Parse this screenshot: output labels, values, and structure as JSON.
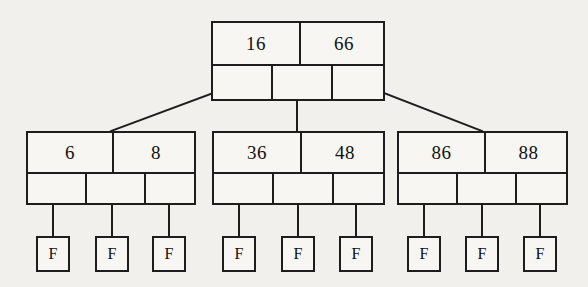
{
  "diagram": {
    "style": {
      "background_color": "#f2f0ed",
      "node_fill": "#f7f6f3",
      "line_color": "#1d1d1d"
    },
    "root": {
      "id": "root-node",
      "keys": [
        "16",
        "66"
      ],
      "x": 211,
      "y": 21,
      "width": 174,
      "height": 80,
      "key_row_height": 41,
      "key_widths": [
        86,
        86
      ],
      "pointer_widths": [
        58,
        58,
        56
      ]
    },
    "internal_nodes": [
      {
        "id": "internal-node-left",
        "keys": [
          "6",
          "8"
        ],
        "x": 26,
        "y": 131,
        "width": 170,
        "height": 74,
        "key_row_height": 39,
        "key_widths": [
          84,
          84
        ],
        "pointer_widths": [
          57,
          57,
          54
        ]
      },
      {
        "id": "internal-node-middle",
        "keys": [
          "36",
          "48"
        ],
        "x": 212,
        "y": 131,
        "width": 173,
        "height": 74,
        "key_row_height": 39,
        "key_widths": [
          86,
          86
        ],
        "pointer_widths": [
          58,
          58,
          55
        ]
      },
      {
        "id": "internal-node-right",
        "keys": [
          "86",
          "88"
        ],
        "x": 397,
        "y": 131,
        "width": 171,
        "height": 74,
        "key_row_height": 39,
        "key_widths": [
          85,
          85
        ],
        "pointer_widths": [
          57,
          57,
          55
        ]
      }
    ],
    "leaves": [
      {
        "id": "leaf-1",
        "label": "F",
        "x": 36,
        "y": 236,
        "width": 34,
        "height": 36
      },
      {
        "id": "leaf-2",
        "label": "F",
        "x": 95,
        "y": 236,
        "width": 34,
        "height": 36
      },
      {
        "id": "leaf-3",
        "label": "F",
        "x": 152,
        "y": 236,
        "width": 34,
        "height": 36
      },
      {
        "id": "leaf-4",
        "label": "F",
        "x": 222,
        "y": 236,
        "width": 34,
        "height": 36
      },
      {
        "id": "leaf-5",
        "label": "F",
        "x": 281,
        "y": 236,
        "width": 34,
        "height": 36
      },
      {
        "id": "leaf-6",
        "label": "F",
        "x": 339,
        "y": 236,
        "width": 34,
        "height": 36
      },
      {
        "id": "leaf-7",
        "label": "F",
        "x": 407,
        "y": 236,
        "width": 34,
        "height": 36
      },
      {
        "id": "leaf-8",
        "label": "F",
        "x": 465,
        "y": 236,
        "width": 34,
        "height": 36
      },
      {
        "id": "leaf-9",
        "label": "F",
        "x": 523,
        "y": 236,
        "width": 34,
        "height": 36
      }
    ],
    "edges": [
      {
        "id": "edge-root-to-left",
        "x1": 240,
        "y1": 83,
        "x2": 111,
        "y2": 131
      },
      {
        "id": "edge-root-to-middle",
        "x1": 297,
        "y1": 83,
        "x2": 297,
        "y2": 131
      },
      {
        "id": "edge-root-to-right",
        "x1": 358,
        "y1": 83,
        "x2": 482,
        "y2": 131
      },
      {
        "id": "edge-left-to-leaf-1",
        "x1": 53,
        "y1": 186,
        "x2": 53,
        "y2": 236
      },
      {
        "id": "edge-left-to-leaf-2",
        "x1": 112,
        "y1": 186,
        "x2": 112,
        "y2": 236
      },
      {
        "id": "edge-left-to-leaf-3",
        "x1": 169,
        "y1": 186,
        "x2": 169,
        "y2": 236
      },
      {
        "id": "edge-middle-to-leaf-4",
        "x1": 239,
        "y1": 186,
        "x2": 239,
        "y2": 236
      },
      {
        "id": "edge-middle-to-leaf-5",
        "x1": 298,
        "y1": 186,
        "x2": 298,
        "y2": 236
      },
      {
        "id": "edge-middle-to-leaf-6",
        "x1": 356,
        "y1": 186,
        "x2": 356,
        "y2": 236
      },
      {
        "id": "edge-right-to-leaf-7",
        "x1": 424,
        "y1": 186,
        "x2": 424,
        "y2": 236
      },
      {
        "id": "edge-right-to-leaf-8",
        "x1": 482,
        "y1": 186,
        "x2": 482,
        "y2": 236
      },
      {
        "id": "edge-right-to-leaf-9",
        "x1": 540,
        "y1": 186,
        "x2": 540,
        "y2": 236
      }
    ]
  }
}
